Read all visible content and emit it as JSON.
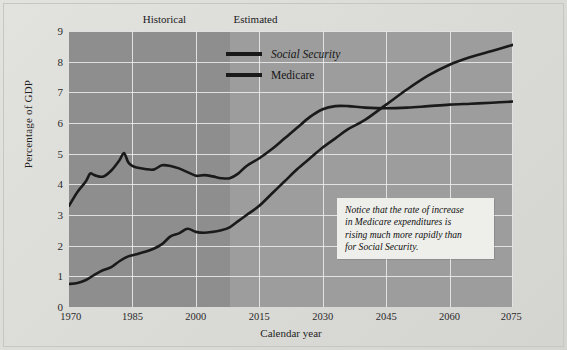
{
  "sections": [
    {
      "label": "Historical",
      "x_frac": 0.215
    },
    {
      "label": "Estimated",
      "x_frac": 0.42
    }
  ],
  "legend": {
    "items": [
      {
        "label": "Social Security",
        "color": "#1a1a1a",
        "italic": true
      },
      {
        "label": "Medicare",
        "color": "#1a1a1a",
        "italic": false
      }
    ]
  },
  "callout": {
    "lines": [
      "Notice that the rate of increase",
      "in Medicare expenditures is",
      "rising much more rapidly than",
      "for Social Security."
    ]
  },
  "chart_data": {
    "type": "line",
    "title": "",
    "xlabel": "Calendar year",
    "ylabel": "Percentage of GDP",
    "xlim": [
      1970,
      2075
    ],
    "ylim": [
      0,
      9
    ],
    "xticks": [
      1970,
      1985,
      2000,
      2015,
      2030,
      2045,
      2060,
      2075
    ],
    "yticks": [
      0,
      1,
      2,
      3,
      4,
      5,
      6,
      7,
      8,
      9
    ],
    "grid": true,
    "legend_position": "top-center",
    "plot_bgcolor": "#9d9d9d",
    "historical_band_color": "#8e8e8e",
    "historical_range": [
      1970,
      2008
    ],
    "estimated_range": [
      2008,
      2075
    ],
    "gridline_color": "#ececec",
    "series": [
      {
        "name": "Social Security",
        "color": "#1a1a1a",
        "x": [
          1970,
          1972,
          1974,
          1975,
          1976,
          1978,
          1980,
          1982,
          1983,
          1984,
          1985,
          1986,
          1988,
          1990,
          1992,
          1994,
          1996,
          1998,
          2000,
          2002,
          2004,
          2006,
          2008,
          2010,
          2012,
          2015,
          2018,
          2021,
          2024,
          2027,
          2030,
          2033,
          2036,
          2040,
          2045,
          2050,
          2055,
          2060,
          2065,
          2070,
          2075
        ],
        "y": [
          3.3,
          3.75,
          4.1,
          4.35,
          4.3,
          4.25,
          4.45,
          4.8,
          5.02,
          4.72,
          4.6,
          4.55,
          4.5,
          4.48,
          4.62,
          4.6,
          4.52,
          4.4,
          4.28,
          4.3,
          4.26,
          4.2,
          4.2,
          4.35,
          4.6,
          4.85,
          5.15,
          5.5,
          5.85,
          6.2,
          6.45,
          6.55,
          6.55,
          6.5,
          6.48,
          6.5,
          6.55,
          6.6,
          6.63,
          6.66,
          6.7
        ]
      },
      {
        "name": "Medicare",
        "color": "#1a1a1a",
        "x": [
          1970,
          1972,
          1974,
          1976,
          1978,
          1980,
          1982,
          1984,
          1986,
          1988,
          1990,
          1992,
          1994,
          1996,
          1998,
          2000,
          2002,
          2004,
          2006,
          2008,
          2010,
          2012,
          2015,
          2018,
          2021,
          2024,
          2027,
          2030,
          2033,
          2036,
          2040,
          2045,
          2050,
          2055,
          2060,
          2065,
          2070,
          2075
        ],
        "y": [
          0.75,
          0.78,
          0.88,
          1.05,
          1.2,
          1.3,
          1.5,
          1.65,
          1.72,
          1.8,
          1.9,
          2.05,
          2.3,
          2.4,
          2.55,
          2.45,
          2.42,
          2.45,
          2.5,
          2.6,
          2.8,
          3.0,
          3.3,
          3.7,
          4.1,
          4.5,
          4.85,
          5.2,
          5.5,
          5.8,
          6.1,
          6.6,
          7.1,
          7.55,
          7.9,
          8.15,
          8.35,
          8.55
        ]
      }
    ]
  }
}
